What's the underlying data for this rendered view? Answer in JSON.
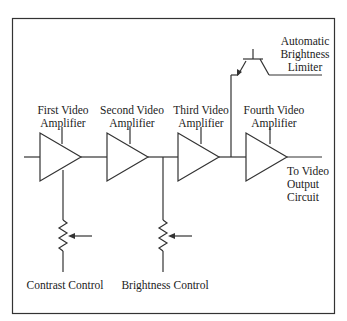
{
  "diagram": {
    "type": "block-schematic",
    "colors": {
      "line": "#333333",
      "text": "#222222",
      "background": "#ffffff"
    },
    "amplifiers": [
      {
        "label_line1": "First Video",
        "label_line2": "Amplifier"
      },
      {
        "label_line1": "Second Video",
        "label_line2": "Amplifier"
      },
      {
        "label_line1": "Third Video",
        "label_line2": "Amplifier"
      },
      {
        "label_line1": "Fourth Video",
        "label_line2": "Amplifier"
      }
    ],
    "limiter": {
      "line1": "Automatic",
      "line2": "Brightness",
      "line3": "Limiter"
    },
    "output": {
      "line1": "To Video",
      "line2": "Output",
      "line3": "Circuit"
    },
    "controls": {
      "contrast": "Contrast Control",
      "brightness": "Brightness Control"
    }
  }
}
